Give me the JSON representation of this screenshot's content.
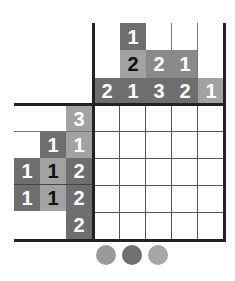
{
  "puzzle": {
    "type": "nonogram",
    "size": {
      "rows": 5,
      "cols": 5
    },
    "column_clues": [
      {
        "col": 1,
        "clues": [
          {
            "value": "2",
            "row": 3,
            "shade": "dark"
          }
        ]
      },
      {
        "col": 2,
        "clues": [
          {
            "value": "1",
            "row": 1,
            "shade": "dark"
          },
          {
            "value": "2",
            "row": 2,
            "shade": "light",
            "text": "black"
          },
          {
            "value": "1",
            "row": 3,
            "shade": "dark"
          }
        ]
      },
      {
        "col": 3,
        "clues": [
          {
            "value": "2",
            "row": 2,
            "shade": "mid"
          },
          {
            "value": "3",
            "row": 3,
            "shade": "dark"
          }
        ]
      },
      {
        "col": 4,
        "clues": [
          {
            "value": "1",
            "row": 2,
            "shade": "mid"
          },
          {
            "value": "2",
            "row": 3,
            "shade": "dark"
          }
        ]
      },
      {
        "col": 5,
        "clues": [
          {
            "value": "1",
            "row": 3,
            "shade": "light"
          }
        ]
      }
    ],
    "row_clues": [
      {
        "row": 1,
        "clues": [
          {
            "value": "3",
            "col": 3,
            "shade": "light"
          }
        ]
      },
      {
        "row": 2,
        "clues": [
          {
            "value": "1",
            "col": 2,
            "shade": "dark"
          },
          {
            "value": "1",
            "col": 3,
            "shade": "light"
          }
        ]
      },
      {
        "row": 3,
        "clues": [
          {
            "value": "1",
            "col": 1,
            "shade": "dark"
          },
          {
            "value": "1",
            "col": 2,
            "shade": "light",
            "text": "black"
          },
          {
            "value": "2",
            "col": 3,
            "shade": "dark"
          }
        ]
      },
      {
        "row": 4,
        "clues": [
          {
            "value": "1",
            "col": 1,
            "shade": "dark"
          },
          {
            "value": "1",
            "col": 2,
            "shade": "light",
            "text": "black"
          },
          {
            "value": "2",
            "col": 3,
            "shade": "dark"
          }
        ]
      },
      {
        "row": 5,
        "clues": [
          {
            "value": "2",
            "col": 3,
            "shade": "dark"
          }
        ]
      }
    ],
    "colors": {
      "dark": "#6e6e6e",
      "mid": "#8a8a8a",
      "light": "#a2a2a2",
      "grid_line": "#222222"
    }
  },
  "palette": [
    {
      "name": "color-1",
      "color": "#9a9a9a"
    },
    {
      "name": "color-2",
      "color": "#707070"
    },
    {
      "name": "color-3",
      "color": "#a6a6a6"
    }
  ],
  "labels": {
    "c1r3": "2",
    "c2r1": "1",
    "c2r2": "2",
    "c2r3": "1",
    "c3r2": "2",
    "c3r3": "3",
    "c4r2": "1",
    "c4r3": "2",
    "c5r3": "1",
    "r1c3": "3",
    "r2c2": "1",
    "r2c3": "1",
    "r3c1": "1",
    "r3c2": "1",
    "r3c3": "2",
    "r4c1": "1",
    "r4c2": "1",
    "r4c3": "2",
    "r5c3": "2"
  }
}
